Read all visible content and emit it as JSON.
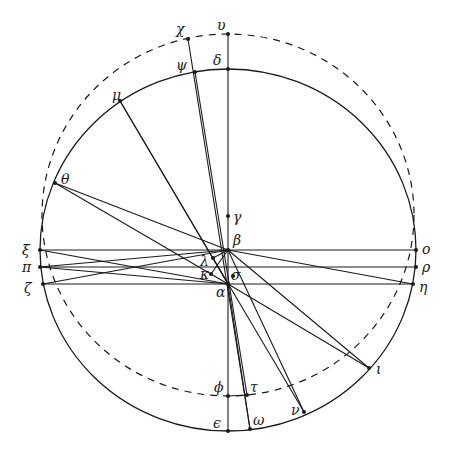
{
  "diagram": {
    "colors": {
      "ink": "#1a1a1a",
      "background": "#ffffff"
    },
    "circles": [
      {
        "name": "solid-circle",
        "style": "solid",
        "cx": 228,
        "cy": 250,
        "rx": 188,
        "ry": 181
      },
      {
        "name": "dashed-circle",
        "style": "dashed",
        "cx": 228,
        "cy": 215,
        "rx": 186,
        "ry": 181
      }
    ],
    "points": [
      {
        "id": "chi",
        "label": "χ",
        "x": 188,
        "y": 39,
        "lx": 176,
        "ly": 34
      },
      {
        "id": "upsilon",
        "label": "υ",
        "x": 228,
        "y": 34,
        "lx": 217,
        "ly": 30
      },
      {
        "id": "psi",
        "label": "ψ",
        "x": 195,
        "y": 72,
        "lx": 176,
        "ly": 70
      },
      {
        "id": "delta",
        "label": "δ",
        "x": 228,
        "y": 69,
        "lx": 213,
        "ly": 65
      },
      {
        "id": "mu",
        "label": "μ",
        "x": 120,
        "y": 101,
        "lx": 112,
        "ly": 100
      },
      {
        "id": "theta",
        "label": "θ",
        "x": 55,
        "y": 183,
        "lx": 61,
        "ly": 184
      },
      {
        "id": "gamma",
        "label": "γ",
        "x": 228,
        "y": 216,
        "lx": 233,
        "ly": 222
      },
      {
        "id": "beta",
        "label": "β",
        "x": 228,
        "y": 250,
        "lx": 233,
        "ly": 245
      },
      {
        "id": "lambda",
        "label": "λ",
        "x": 213,
        "y": 258,
        "lx": 200,
        "ly": 266
      },
      {
        "id": "kappa",
        "label": "κ",
        "x": 211,
        "y": 274,
        "lx": 200,
        "ly": 279
      },
      {
        "id": "sigma",
        "label": "σ",
        "x": 233,
        "y": 276,
        "lx": 231,
        "ly": 280
      },
      {
        "id": "alpha",
        "label": "α",
        "x": 228,
        "y": 284,
        "lx": 216,
        "ly": 297
      },
      {
        "id": "xi",
        "label": "ξ",
        "x": 40,
        "y": 250,
        "lx": 22,
        "ly": 255
      },
      {
        "id": "pi",
        "label": "π",
        "x": 40,
        "y": 267,
        "lx": 22,
        "ly": 272
      },
      {
        "id": "zeta",
        "label": "ζ",
        "x": 43,
        "y": 284,
        "lx": 24,
        "ly": 293
      },
      {
        "id": "omicron",
        "label": "ο",
        "x": 416,
        "y": 250,
        "lx": 422,
        "ly": 254
      },
      {
        "id": "rho",
        "label": "ρ",
        "x": 416,
        "y": 267,
        "lx": 422,
        "ly": 272
      },
      {
        "id": "eta",
        "label": "η",
        "x": 413,
        "y": 284,
        "lx": 419,
        "ly": 292
      },
      {
        "id": "iota",
        "label": "ι",
        "x": 369,
        "y": 368,
        "lx": 376,
        "ly": 374
      },
      {
        "id": "phi",
        "label": "ϕ",
        "x": 228,
        "y": 396,
        "lx": 214,
        "ly": 392
      },
      {
        "id": "tau",
        "label": "τ",
        "x": 247,
        "y": 395,
        "lx": 250,
        "ly": 392
      },
      {
        "id": "nu",
        "label": "ν",
        "x": 304,
        "y": 412,
        "lx": 291,
        "ly": 415
      },
      {
        "id": "omega",
        "label": "ω",
        "x": 250,
        "y": 429,
        "lx": 253,
        "ly": 425
      },
      {
        "id": "epsilon",
        "label": "ϵ",
        "x": 228,
        "y": 431,
        "lx": 213,
        "ly": 428
      }
    ],
    "segments": [
      [
        "upsilon",
        "epsilon"
      ],
      [
        "xi",
        "omicron"
      ],
      [
        "pi",
        "rho"
      ],
      [
        "zeta",
        "eta"
      ],
      [
        "chi",
        "omega"
      ],
      [
        "psi",
        "tau"
      ],
      [
        "mu",
        "nu"
      ],
      [
        "mu",
        "alpha"
      ],
      [
        "theta",
        "beta"
      ],
      [
        "theta",
        "alpha"
      ],
      [
        "beta",
        "eta"
      ],
      [
        "beta",
        "iota"
      ],
      [
        "alpha",
        "iota"
      ],
      [
        "beta",
        "nu"
      ],
      [
        "xi",
        "alpha"
      ],
      [
        "pi",
        "beta"
      ],
      [
        "zeta",
        "beta"
      ],
      [
        "pi",
        "alpha"
      ],
      [
        "lambda",
        "beta"
      ],
      [
        "kappa",
        "beta"
      ],
      [
        "lambda",
        "alpha"
      ],
      [
        "alpha",
        "omega"
      ],
      [
        "phi",
        "tau"
      ]
    ]
  }
}
